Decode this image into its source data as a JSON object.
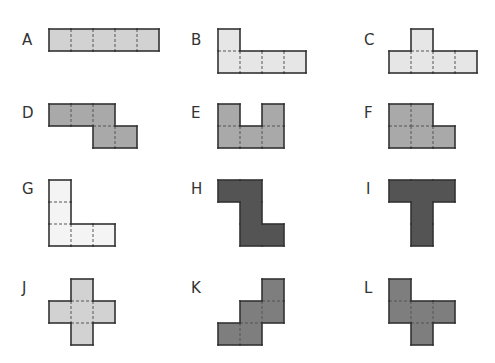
{
  "cell_size": 22,
  "shapes": [
    {
      "id": "A",
      "label": "A",
      "label_pos": [
        22,
        33
      ],
      "origin": [
        48,
        28
      ],
      "fill": "#d2d2d2",
      "cells": [
        [
          0,
          0
        ],
        [
          1,
          0
        ],
        [
          2,
          0
        ],
        [
          3,
          0
        ],
        [
          4,
          0
        ]
      ]
    },
    {
      "id": "B",
      "label": "B",
      "label_pos": [
        191,
        33
      ],
      "origin": [
        217,
        28
      ],
      "fill": "#e6e6e6",
      "cells": [
        [
          0,
          0
        ],
        [
          0,
          1
        ],
        [
          1,
          1
        ],
        [
          2,
          1
        ],
        [
          3,
          1
        ]
      ]
    },
    {
      "id": "C",
      "label": "C",
      "label_pos": [
        364,
        33
      ],
      "origin": [
        388,
        28
      ],
      "fill": "#e6e6e6",
      "cells": [
        [
          1,
          0
        ],
        [
          0,
          1
        ],
        [
          1,
          1
        ],
        [
          2,
          1
        ],
        [
          3,
          1
        ]
      ]
    },
    {
      "id": "D",
      "label": "D",
      "label_pos": [
        22,
        106
      ],
      "origin": [
        48,
        103
      ],
      "fill": "#a9a9a9",
      "cells": [
        [
          0,
          0
        ],
        [
          1,
          0
        ],
        [
          2,
          0
        ],
        [
          2,
          1
        ],
        [
          3,
          1
        ]
      ]
    },
    {
      "id": "E",
      "label": "E",
      "label_pos": [
        191,
        106
      ],
      "origin": [
        217,
        103
      ],
      "fill": "#a9a9a9",
      "cells": [
        [
          0,
          0
        ],
        [
          2,
          0
        ],
        [
          0,
          1
        ],
        [
          1,
          1
        ],
        [
          2,
          1
        ]
      ]
    },
    {
      "id": "F",
      "label": "F",
      "label_pos": [
        364,
        106
      ],
      "origin": [
        388,
        103
      ],
      "fill": "#a9a9a9",
      "cells": [
        [
          0,
          0
        ],
        [
          1,
          0
        ],
        [
          0,
          1
        ],
        [
          1,
          1
        ],
        [
          2,
          1
        ]
      ]
    },
    {
      "id": "G",
      "label": "G",
      "label_pos": [
        22,
        182
      ],
      "origin": [
        48,
        179
      ],
      "fill": "#f4f4f4",
      "cells": [
        [
          0,
          0
        ],
        [
          0,
          1
        ],
        [
          0,
          2
        ],
        [
          1,
          2
        ],
        [
          2,
          2
        ]
      ]
    },
    {
      "id": "H",
      "label": "H",
      "label_pos": [
        191,
        182
      ],
      "origin": [
        217,
        179
      ],
      "fill": "#545454",
      "cells": [
        [
          0,
          0
        ],
        [
          1,
          0
        ],
        [
          1,
          1
        ],
        [
          1,
          2
        ],
        [
          2,
          2
        ]
      ]
    },
    {
      "id": "I",
      "label": "I",
      "label_pos": [
        366,
        182
      ],
      "origin": [
        388,
        179
      ],
      "fill": "#545454",
      "cells": [
        [
          0,
          0
        ],
        [
          1,
          0
        ],
        [
          2,
          0
        ],
        [
          1,
          1
        ],
        [
          1,
          2
        ]
      ]
    },
    {
      "id": "J",
      "label": "J",
      "label_pos": [
        22,
        281
      ],
      "origin": [
        48,
        278
      ],
      "fill": "#d2d2d2",
      "cells": [
        [
          1,
          0
        ],
        [
          0,
          1
        ],
        [
          1,
          1
        ],
        [
          2,
          1
        ],
        [
          1,
          2
        ]
      ]
    },
    {
      "id": "K",
      "label": "K",
      "label_pos": [
        191,
        281
      ],
      "origin": [
        217,
        278
      ],
      "fill": "#7e7e7e",
      "cells": [
        [
          2,
          0
        ],
        [
          1,
          1
        ],
        [
          2,
          1
        ],
        [
          0,
          2
        ],
        [
          1,
          2
        ]
      ]
    },
    {
      "id": "L",
      "label": "L",
      "label_pos": [
        364,
        281
      ],
      "origin": [
        388,
        278
      ],
      "fill": "#7e7e7e",
      "cells": [
        [
          0,
          0
        ],
        [
          0,
          1
        ],
        [
          1,
          1
        ],
        [
          2,
          1
        ],
        [
          1,
          2
        ]
      ]
    }
  ],
  "stroke": "#333333",
  "dash_stroke": "#555555"
}
